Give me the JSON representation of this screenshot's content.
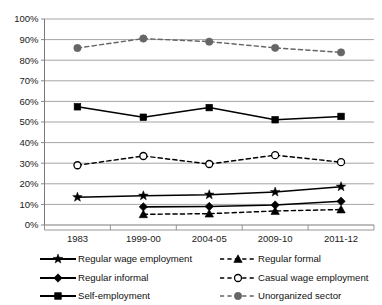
{
  "chart_data": {
    "type": "line",
    "title": "",
    "xlabel": "",
    "ylabel": "",
    "ylim": [
      0,
      100
    ],
    "yticks": [
      "0%",
      "10%",
      "20%",
      "30%",
      "40%",
      "50%",
      "60%",
      "70%",
      "80%",
      "90%",
      "100%"
    ],
    "ytick_values": [
      0,
      10,
      20,
      30,
      40,
      50,
      60,
      70,
      80,
      90,
      100
    ],
    "grid": true,
    "legend_position": "bottom",
    "categories": [
      "1983",
      "1999-00",
      "2004-05",
      "2009-10",
      "2011-12"
    ],
    "series": [
      {
        "name": "Regular wage employment",
        "values": [
          13.5,
          14.2,
          14.7,
          16.0,
          18.6
        ],
        "marker": "star",
        "linestyle": "solid",
        "color": "#000000"
      },
      {
        "name": "Regular informal",
        "values": [
          null,
          8.8,
          9.0,
          9.7,
          11.5
        ],
        "marker": "diamond",
        "linestyle": "solid",
        "color": "#000000"
      },
      {
        "name": "Self-employment",
        "values": [
          57.4,
          52.3,
          57.0,
          51.1,
          52.7
        ],
        "marker": "square",
        "linestyle": "solid",
        "color": "#000000"
      },
      {
        "name": "Regular formal",
        "values": [
          null,
          5.2,
          5.5,
          6.8,
          7.5
        ],
        "marker": "triangle",
        "linestyle": "dashed",
        "color": "#000000"
      },
      {
        "name": "Casual wage employment",
        "values": [
          29.0,
          33.5,
          29.6,
          33.9,
          30.5
        ],
        "marker": "open-circle",
        "linestyle": "dashed",
        "color": "#000000"
      },
      {
        "name": "Unorganized sector",
        "values": [
          85.9,
          90.5,
          89.0,
          86.0,
          83.8
        ],
        "marker": "circle",
        "linestyle": "dashed",
        "color": "#666666"
      }
    ]
  },
  "legend": {
    "left": [
      {
        "label": "Regular wage employment",
        "marker": "star",
        "linestyle": "solid",
        "color": "#000000"
      },
      {
        "label": "Regular informal",
        "marker": "diamond",
        "linestyle": "solid",
        "color": "#000000"
      },
      {
        "label": "Self-employment",
        "marker": "square",
        "linestyle": "solid",
        "color": "#000000"
      }
    ],
    "right": [
      {
        "label": "Regular formal",
        "marker": "triangle",
        "linestyle": "dashed",
        "color": "#000000"
      },
      {
        "label": "Casual wage employment",
        "marker": "open-circle",
        "linestyle": "dashed",
        "color": "#000000"
      },
      {
        "label": "Unorganized sector",
        "marker": "circle",
        "linestyle": "dashed",
        "color": "#666666"
      }
    ]
  }
}
